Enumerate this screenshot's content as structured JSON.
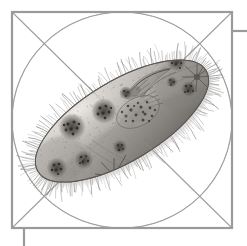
{
  "figure": {
    "title": "Ciliate protozoan (Paramecium) scientific illustration",
    "caption": "Grayscale stipple-and-wash drawing of a ciliate protozoan overlaid with a geometric proportion construction",
    "medium": "grayscale ink wash and stipple",
    "background_color": "#ffffff"
  },
  "construction": {
    "frame": {
      "label": "square construction frame",
      "stroke_color": "#9a9a9a",
      "stroke_width": 2.2,
      "x": 12,
      "y": 12,
      "width": 220,
      "height": 216
    },
    "circle": {
      "label": "inscribed circle",
      "stroke_color": "#a8a8a8",
      "stroke_width": 1.1,
      "center_x": 122,
      "center_y": 120,
      "radius_x": 110,
      "radius_y": 108
    },
    "diagonals": {
      "label": "corner-to-corner diagonals",
      "stroke_color": "#a8a8a8",
      "stroke_width": 1.1
    },
    "ticks": [
      {
        "name": "top-right-tick",
        "orientation": "horizontal",
        "x1": 232,
        "y1": 31,
        "x2": 247,
        "y2": 31
      },
      {
        "name": "bottom-left-tick",
        "orientation": "vertical",
        "x1": 24,
        "y1": 228,
        "x2": 24,
        "y2": 246
      }
    ],
    "tick_color": "#9a9a9a",
    "tick_width": 2.2
  },
  "organism": {
    "common_name": "Paramecium",
    "group": "Ciliophora",
    "orientation_degrees": -31,
    "body": {
      "label": "cell body (pellicle outline)",
      "fill_light": "#cfcbc6",
      "fill_mid": "#a3a09c",
      "fill_dark": "#6e6b68",
      "outline_color": "#5c5a57"
    },
    "cilia": {
      "label": "cilia fringe",
      "color": "#6b6967",
      "count": 210,
      "length_px": 13
    },
    "oral_groove": {
      "label": "oral groove / buccal cavity",
      "color": "#57544f"
    },
    "macronucleus": {
      "label": "macronucleus",
      "cx": 138,
      "cy": 112,
      "rx": 24,
      "ry": 15,
      "fill": "#8d8a86"
    },
    "food_vacuoles": [
      {
        "name": "food-vacuole-1",
        "cx": 72,
        "cy": 127,
        "r": 13
      },
      {
        "name": "food-vacuole-2",
        "cx": 104,
        "cy": 111,
        "r": 12
      },
      {
        "name": "food-vacuole-3",
        "cx": 126,
        "cy": 93,
        "r": 6
      },
      {
        "name": "food-vacuole-4",
        "cx": 172,
        "cy": 82,
        "r": 5
      },
      {
        "name": "food-vacuole-5",
        "cx": 189,
        "cy": 89,
        "r": 8
      },
      {
        "name": "food-vacuole-6",
        "cx": 57,
        "cy": 168,
        "r": 10
      },
      {
        "name": "food-vacuole-7",
        "cx": 84,
        "cy": 160,
        "r": 9
      },
      {
        "name": "food-vacuole-8",
        "cx": 120,
        "cy": 147,
        "r": 7
      },
      {
        "name": "food-vacuole-9",
        "cx": 177,
        "cy": 62,
        "r": 9
      }
    ],
    "contractile_vacuoles": [
      {
        "name": "contractile-vacuole-anterior",
        "cx": 196,
        "cy": 76,
        "radiating_canals": 9
      },
      {
        "name": "contractile-vacuole-posterior",
        "cx": 114,
        "cy": 176,
        "radiating_canals": 10
      }
    ],
    "stipple": {
      "label": "cytoplasm stipple texture",
      "color": "#7d7a76",
      "dot_count": 420
    }
  },
  "palette": {
    "paper": "#ffffff",
    "frame_gray": "#9a9a9a",
    "guide_gray": "#a8a8a8",
    "body_light": "#d2cec9",
    "body_mid": "#a5a29d",
    "body_shadow": "#6d6a66",
    "ink": "#4a4846"
  }
}
